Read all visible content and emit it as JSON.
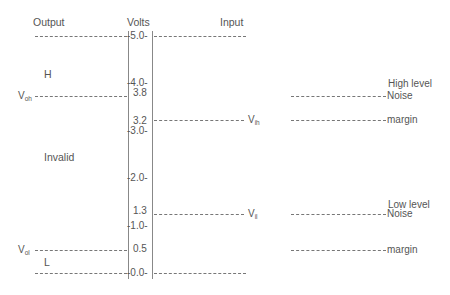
{
  "headers": {
    "output": "Output",
    "volts": "Volts",
    "input": "Input"
  },
  "output_labels": {
    "high": "H",
    "invalid": "Invalid",
    "low": "L",
    "voh": {
      "main": "V",
      "sub": "oh"
    },
    "vol": {
      "main": "V",
      "sub": "ol"
    }
  },
  "input_labels": {
    "vih": {
      "main": "V",
      "sub": "ih"
    },
    "vil": {
      "main": "V",
      "sub": "il"
    }
  },
  "scale_ticks": [
    {
      "value": 5.0,
      "label": "-5.0-"
    },
    {
      "value": 4.0,
      "label": "-4.0-"
    },
    {
      "value": 3.0,
      "label": "-3.0-"
    },
    {
      "value": 2.0,
      "label": "-2.0-"
    },
    {
      "value": 1.0,
      "label": "-1.0-"
    },
    {
      "value": 0.0,
      "label": "-0.0-"
    }
  ],
  "threshold_values": [
    {
      "value": 3.8,
      "label": "3.8"
    },
    {
      "value": 3.2,
      "label": "3.2"
    },
    {
      "value": 1.3,
      "label": "1.3"
    },
    {
      "value": 0.5,
      "label": "0.5"
    }
  ],
  "noise_margins": {
    "high": {
      "line1": "High level",
      "line2": "Noise",
      "line3": "margin"
    },
    "low": {
      "line1": "Low level",
      "line2": "Noise",
      "line3": "margin"
    }
  }
}
